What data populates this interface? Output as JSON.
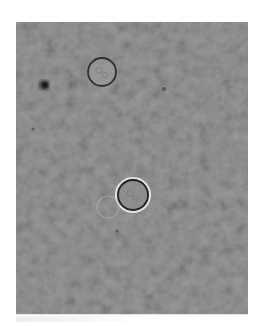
{
  "image": {
    "kind": "brightfield-micrograph",
    "background_color": "#ffffff",
    "field_color": "#8c8c8c",
    "frame": {
      "x": 16,
      "y": 22,
      "width": 232,
      "height": 292
    }
  },
  "features": {
    "cells": [
      {
        "label": "cell-upper",
        "cx": 102,
        "cy": 72,
        "r": 14,
        "ring_color": "#2f2f2f",
        "fill_color": "#9a9a9a"
      },
      {
        "label": "cell-lower",
        "cx": 133,
        "cy": 195,
        "r": 15,
        "ring_color": "#222222",
        "halo_color": "#e2e2e2",
        "fill_color": "#8e8e8e"
      },
      {
        "label": "ghost-cell",
        "cx": 108,
        "cy": 207,
        "r": 11,
        "ring_color": "#b0b0b0"
      }
    ],
    "debris": [
      {
        "label": "dark-speck",
        "cx": 44,
        "cy": 85,
        "r": 5,
        "color": "#2a2a2a"
      },
      {
        "label": "small-speck",
        "cx": 164,
        "cy": 89,
        "r": 2,
        "color": "#555555"
      },
      {
        "label": "small-speck-2",
        "cx": 33,
        "cy": 129,
        "r": 1.5,
        "color": "#555555"
      },
      {
        "label": "small-speck-3",
        "cx": 117,
        "cy": 231,
        "r": 1.5,
        "color": "#555555"
      }
    ]
  }
}
